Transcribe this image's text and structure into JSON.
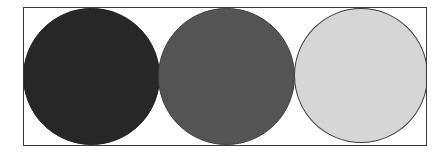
{
  "figure": {
    "frame": {
      "border_color": "#3a3a3a",
      "background": "#ffffff"
    },
    "circles": [
      {
        "label": "dark",
        "fill": "#272727",
        "border": "#1e1e1e"
      },
      {
        "label": "medium",
        "fill": "#545454",
        "border": "#404040"
      },
      {
        "label": "light",
        "fill": "#d6d6d6",
        "border": "#3c3c3c"
      }
    ]
  }
}
